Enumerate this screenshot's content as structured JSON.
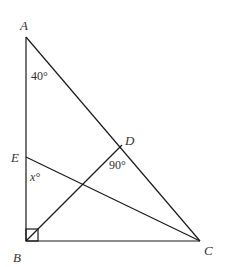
{
  "diagram": {
    "points": {
      "A": {
        "label": "A",
        "x": 26,
        "y": 37
      },
      "B": {
        "label": "B",
        "x": 26,
        "y": 241
      },
      "C": {
        "label": "C",
        "x": 200,
        "y": 241
      },
      "D": {
        "label": "D",
        "x": 122,
        "y": 145
      },
      "E": {
        "label": "E",
        "x": 26,
        "y": 157
      }
    },
    "segments": [
      "AB",
      "BC",
      "AC",
      "BD",
      "EC"
    ],
    "angles": {
      "A": "40°",
      "D": "90°",
      "E": "x°",
      "B": "right-angle"
    },
    "colors": {
      "stroke": "#1a1a1a",
      "text": "#333333"
    }
  }
}
